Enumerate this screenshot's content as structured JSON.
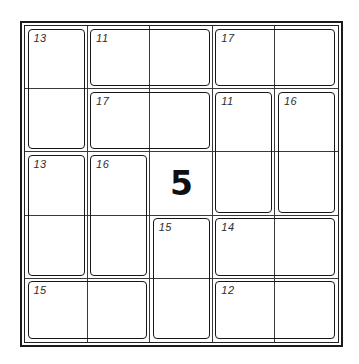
{
  "puzzle": {
    "type": "killer-cage-grid",
    "grid_size": 5,
    "colors": {
      "background": "#ffffff",
      "outer_border": "#1b1b1b",
      "grid_line": "#3a3a3a",
      "cage_border": "#161616",
      "cage_label": "#2d2d2d",
      "given_digit": "#101010"
    },
    "given_cells": [
      {
        "row": 3,
        "col": 3,
        "value": "5"
      }
    ],
    "cages": [
      {
        "sum": "13",
        "row": 1,
        "col": 1,
        "rows": 2,
        "cols": 1
      },
      {
        "sum": "11",
        "row": 1,
        "col": 2,
        "rows": 1,
        "cols": 2
      },
      {
        "sum": "17",
        "row": 1,
        "col": 4,
        "rows": 1,
        "cols": 2
      },
      {
        "sum": "17",
        "row": 2,
        "col": 2,
        "rows": 1,
        "cols": 2
      },
      {
        "sum": "11",
        "row": 2,
        "col": 4,
        "rows": 2,
        "cols": 1
      },
      {
        "sum": "16",
        "row": 2,
        "col": 5,
        "rows": 2,
        "cols": 1
      },
      {
        "sum": "13",
        "row": 3,
        "col": 1,
        "rows": 2,
        "cols": 1
      },
      {
        "sum": "16",
        "row": 3,
        "col": 2,
        "rows": 2,
        "cols": 1
      },
      {
        "sum": "15",
        "row": 4,
        "col": 3,
        "rows": 2,
        "cols": 1
      },
      {
        "sum": "14",
        "row": 4,
        "col": 4,
        "rows": 1,
        "cols": 2
      },
      {
        "sum": "15",
        "row": 5,
        "col": 1,
        "rows": 1,
        "cols": 2
      },
      {
        "sum": "12",
        "row": 5,
        "col": 4,
        "rows": 1,
        "cols": 2
      }
    ]
  }
}
